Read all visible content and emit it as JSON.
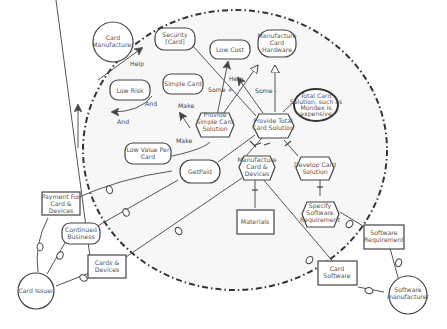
{
  "diagram": {
    "type": "iStar strategic rationale model",
    "boundary": {
      "label": "",
      "owner": "Card Manufacturer"
    },
    "actors": [
      {
        "id": "card-manufacturer",
        "label_lines": [
          "Card",
          "Manufacturer"
        ]
      },
      {
        "id": "card-issuer",
        "label_lines": [
          "Card Issuer"
        ]
      },
      {
        "id": "software-manufacturer",
        "label_lines": [
          "Software",
          "manufacturer"
        ]
      }
    ],
    "softgoals": [
      {
        "id": "security",
        "label_lines": [
          "Security",
          "[Card]"
        ]
      },
      {
        "id": "low-cost",
        "label_lines": [
          "Low Cost"
        ]
      },
      {
        "id": "manufacture-card-hardware",
        "label_lines": [
          "Manufacture",
          "Card",
          "Hardware"
        ]
      },
      {
        "id": "low-risk",
        "label_lines": [
          "Low Risk"
        ]
      },
      {
        "id": "simple-card",
        "label_lines": [
          "Simple Card"
        ]
      },
      {
        "id": "low-value-per-card",
        "label_lines": [
          "Low Value Per",
          "Card"
        ]
      },
      {
        "id": "continued-business",
        "label_lines": [
          "Continued",
          "Business"
        ]
      }
    ],
    "goals": [
      {
        "id": "getpaid",
        "label_lines": [
          "GetPaid"
        ]
      }
    ],
    "tasks": [
      {
        "id": "provide-simple-card-solution",
        "label_lines": [
          "Provide",
          "Simple Card",
          "Solution"
        ]
      },
      {
        "id": "provide-total-card-solution",
        "label_lines": [
          "Provide Total",
          "Card Solution"
        ]
      },
      {
        "id": "manufacture-card-devices",
        "label_lines": [
          "Manufacture",
          "Card &",
          "Devices"
        ]
      },
      {
        "id": "develop-card-solution",
        "label_lines": [
          "Develop Card",
          "Solution"
        ]
      },
      {
        "id": "specify-software-requirement",
        "label_lines": [
          "Specify",
          "Software",
          "Requirement"
        ]
      }
    ],
    "resources": [
      {
        "id": "payment",
        "label_lines": [
          "Payment For",
          "Card &",
          "Devices"
        ]
      },
      {
        "id": "cards-devices",
        "label_lines": [
          "Cards &",
          "Devices"
        ]
      },
      {
        "id": "materials",
        "label_lines": [
          "Materials"
        ]
      },
      {
        "id": "software-requirement",
        "label_lines": [
          "Software",
          "Requirement"
        ]
      },
      {
        "id": "card-software",
        "label_lines": [
          "Card",
          "Software"
        ]
      }
    ],
    "beliefs": [
      {
        "id": "total-card-belief",
        "label_lines": [
          "Total Card",
          "Solution, such as",
          "Mondex is",
          "expensive"
        ]
      }
    ],
    "link_labels": {
      "help1": "Help",
      "help2": "Help",
      "and1": "And",
      "and2": "And",
      "make1": "Make",
      "make2": "Make",
      "some_plus": "Some +",
      "some_minus": "Some -"
    },
    "colors": {
      "stroke": "#444444",
      "boundary_fill": "#f6f6f6",
      "text": "#555555",
      "background": "#ffffff"
    }
  }
}
